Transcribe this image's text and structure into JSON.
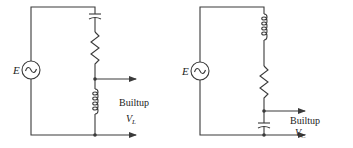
{
  "diagrams": [
    {
      "id": "left",
      "source_label": "E",
      "source_symbol": "~",
      "components_top_to_bottom": [
        "capacitor",
        "resistor",
        "inductor"
      ],
      "output_label": "Builtup",
      "output_voltage": "V",
      "output_subscript": "L"
    },
    {
      "id": "right",
      "source_label": "E",
      "source_symbol": "~",
      "components_top_to_bottom": [
        "inductor",
        "resistor",
        "capacitor"
      ],
      "output_label": "Builtup",
      "output_voltage": "V",
      "output_subscript": "C"
    }
  ],
  "colors": {
    "line": "#3a3a3a",
    "text": "#222222",
    "background": "#ffffff"
  }
}
